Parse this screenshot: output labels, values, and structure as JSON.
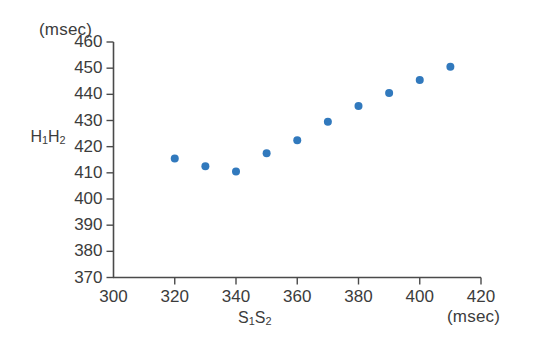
{
  "chart_data": {
    "type": "scatter",
    "title": "",
    "xlabel": "S₁S₂",
    "ylabel": "H₁H₂",
    "x_unit": "(msec)",
    "y_unit": "(msec)",
    "xlim": [
      300,
      420
    ],
    "ylim": [
      370,
      460
    ],
    "xticks": [
      300,
      320,
      340,
      360,
      380,
      400,
      420
    ],
    "yticks": [
      370,
      380,
      390,
      400,
      410,
      420,
      430,
      440,
      450,
      460
    ],
    "xtick_labels": [
      "300",
      "320",
      "340",
      "360",
      "380",
      "400",
      "420"
    ],
    "ytick_labels": [
      "370",
      "380",
      "390",
      "400",
      "410",
      "420",
      "430",
      "440",
      "450",
      "460"
    ],
    "grid": false,
    "legend": null,
    "marker_color": "#3179bd",
    "marker_size": 7,
    "x": [
      320,
      330,
      340,
      350,
      360,
      370,
      380,
      390,
      400,
      410
    ],
    "y": [
      415.5,
      412.5,
      410.5,
      417.5,
      422.5,
      429.5,
      435.5,
      440.5,
      445.5,
      450.5
    ],
    "series": [
      {
        "name": "H1H2 vs S1S2",
        "points": [
          {
            "x": 320,
            "y": 415.5
          },
          {
            "x": 330,
            "y": 412.5
          },
          {
            "x": 340,
            "y": 410.5
          },
          {
            "x": 350,
            "y": 417.5
          },
          {
            "x": 360,
            "y": 422.5
          },
          {
            "x": 370,
            "y": 429.5
          },
          {
            "x": 380,
            "y": 435.5
          },
          {
            "x": 390,
            "y": 440.5
          },
          {
            "x": 400,
            "y": 445.5
          },
          {
            "x": 410,
            "y": 450.5
          }
        ]
      }
    ]
  },
  "axes": {
    "y_unit_caption": "(msec)",
    "x_unit_caption": "(msec)",
    "y_axis_title": "H₁H₂",
    "x_axis_title": "S₁S₂"
  }
}
